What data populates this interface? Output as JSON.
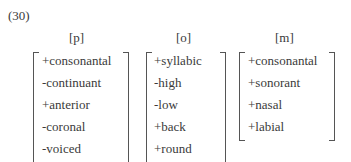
{
  "example_number": "(30)",
  "matrices": [
    {
      "segment": "[p]",
      "features": [
        "+consonantal",
        "-continuant",
        "+anterior",
        "-coronal",
        "-voiced"
      ]
    },
    {
      "segment": "[o]",
      "features": [
        "+syllabic",
        "-high",
        "-low",
        "+back",
        "+round"
      ]
    },
    {
      "segment": "[m]",
      "features": [
        "+consonantal",
        "+sonorant",
        "+nasal",
        "+labial"
      ]
    }
  ]
}
